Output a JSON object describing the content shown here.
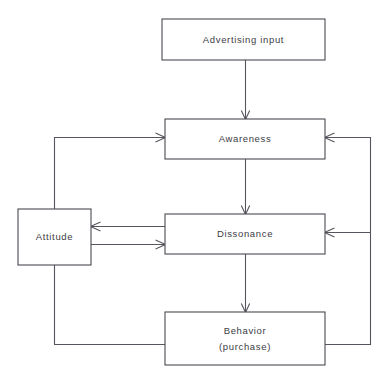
{
  "diagram": {
    "type": "flowchart",
    "title": "",
    "nodes": [
      {
        "id": "advertising-input",
        "label": "Advertising input",
        "lines": [
          "Advertising input"
        ],
        "x": 162,
        "y": 19,
        "w": 163,
        "h": 41
      },
      {
        "id": "awareness",
        "label": "Awareness",
        "lines": [
          "Awareness"
        ],
        "x": 165,
        "y": 119,
        "w": 160,
        "h": 40
      },
      {
        "id": "attitude",
        "label": "Attitude",
        "lines": [
          "Attitude"
        ],
        "x": 18,
        "y": 209,
        "w": 73,
        "h": 56
      },
      {
        "id": "dissonance",
        "label": "Dissonance",
        "lines": [
          "Dissonance"
        ],
        "x": 165,
        "y": 214,
        "w": 160,
        "h": 40
      },
      {
        "id": "behavior",
        "label": "Behavior (purchase)",
        "lines": [
          "Behavior",
          "(purchase)"
        ],
        "x": 165,
        "y": 312,
        "w": 160,
        "h": 53
      }
    ],
    "edges": [
      {
        "id": "advertising-to-awareness",
        "from": "advertising-input",
        "to": "awareness",
        "arrow": true
      },
      {
        "id": "awareness-to-dissonance",
        "from": "awareness",
        "to": "dissonance",
        "arrow": true
      },
      {
        "id": "dissonance-to-behavior",
        "from": "dissonance",
        "to": "behavior",
        "arrow": true
      },
      {
        "id": "dissonance-to-attitude",
        "from": "dissonance",
        "to": "attitude",
        "arrow": true
      },
      {
        "id": "attitude-to-dissonance",
        "from": "attitude",
        "to": "dissonance",
        "arrow": true
      },
      {
        "id": "behavior-to-awareness-left",
        "from": "behavior",
        "to": "awareness",
        "arrow": true
      },
      {
        "id": "behavior-to-awareness-right",
        "from": "behavior",
        "to": "awareness",
        "arrow": true
      },
      {
        "id": "behavior-to-dissonance-right",
        "from": "behavior",
        "to": "dissonance",
        "arrow": true
      }
    ],
    "colors": {
      "background": "#ffffff",
      "stroke": "#55555d",
      "box_stroke": "#4a4a52",
      "text": "#3c3c44"
    }
  }
}
